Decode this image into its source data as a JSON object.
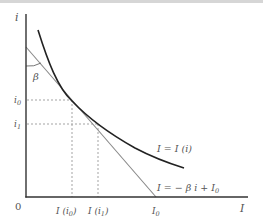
{
  "diagram": {
    "axes": {
      "y_label": "i",
      "x_label": "I",
      "origin_label": "0"
    },
    "y_ticks": [
      {
        "label": "i",
        "sub": "0"
      },
      {
        "label": "i",
        "sub": "1"
      }
    ],
    "x_ticks": [
      {
        "label": "I (i",
        "sub": "0",
        "close": ")"
      },
      {
        "label": "I (i",
        "sub": "1",
        "close": ")"
      },
      {
        "label": "I",
        "sub": "0",
        "close": ""
      }
    ],
    "angle_label": "β",
    "curve_label": "I = I (i)",
    "line_label_prefix": "I = − β i + I",
    "line_label_sub": "0",
    "colors": {
      "curve": "#222222",
      "tangent": "#888888",
      "axis": "#333333",
      "guides": "#999999",
      "text": "#555555"
    }
  }
}
